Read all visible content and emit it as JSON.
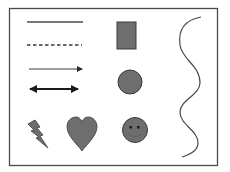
{
  "colors": {
    "background": "#ffffff",
    "frame": "#4a4a4a",
    "stroke": "#3a3a3a",
    "fill": "#6e6e6e",
    "fill_dark": "#5a5a5a",
    "eyes": "#1a1a1a"
  },
  "shapes": [
    {
      "name": "solid-line",
      "type": "line"
    },
    {
      "name": "dashed-line",
      "type": "line"
    },
    {
      "name": "arrow",
      "type": "line"
    },
    {
      "name": "double-arrow",
      "type": "line"
    },
    {
      "name": "square",
      "type": "rectangle"
    },
    {
      "name": "circle",
      "type": "ellipse"
    },
    {
      "name": "lightning-bolt",
      "type": "shape"
    },
    {
      "name": "heart",
      "type": "shape"
    },
    {
      "name": "smiley-face",
      "type": "shape"
    },
    {
      "name": "wave-curve",
      "type": "curve"
    }
  ]
}
